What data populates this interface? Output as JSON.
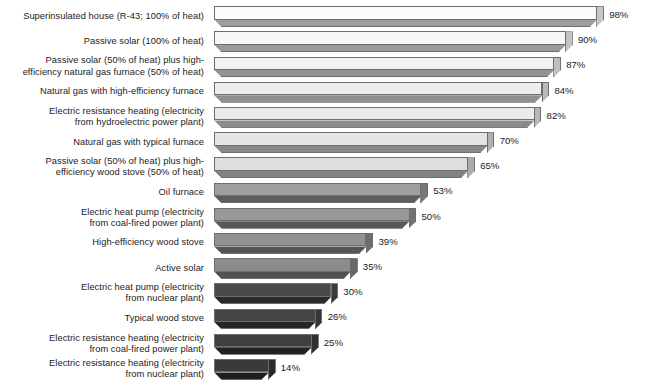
{
  "chart_data": {
    "type": "bar",
    "orientation": "horizontal",
    "title": "",
    "subtitle": "",
    "xlabel": "",
    "ylabel": "",
    "xlim": [
      0,
      100
    ],
    "grid": false,
    "legend": null,
    "value_suffix": "%",
    "categories": [
      "Superinsulated house (R-43; 100% of heat)",
      "Passive solar (100% of heat)",
      "Passive solar (50% of heat) plus high-efficiency natural gas furnace (50% of heat)",
      "Natural gas with high-efficiency furnace",
      "Electric resistance heating (electricity from hydroelectric power plant)",
      "Natural gas with typical furnace",
      "Passive solar (50% of heat) plus high-efficiency wood stove (50% of heat)",
      "Oil furnace",
      "Electric heat pump (electricity from coal-fired power plant)",
      "High-efficiency wood stove",
      "Active solar",
      "Electric heat pump (electricity from nuclear plant)",
      "Typical wood stove",
      "Electric resistance heating (electricity from coal-fired power plant)",
      "Electric resistance heating (electricity from nuclear plant)"
    ],
    "values": [
      98,
      90,
      87,
      84,
      82,
      70,
      65,
      53,
      50,
      39,
      35,
      30,
      26,
      25,
      14
    ]
  },
  "rows": [
    {
      "lines": [
        "Superinsulated house (R-43; 100% of heat)"
      ],
      "value": 98,
      "value_label": "98%",
      "face_color": "#fbfbfb",
      "bottom_color": "#9d9d9d",
      "cap_color": "#c7c7c7"
    },
    {
      "lines": [
        "Passive solar (100% of heat)"
      ],
      "value": 90,
      "value_label": "90%",
      "face_color": "#f7f7f7",
      "bottom_color": "#999999",
      "cap_color": "#c3c3c3"
    },
    {
      "lines": [
        "Passive solar (50% of heat) plus high-",
        "efficiency natural gas furnace (50% of heat)"
      ],
      "value": 87,
      "value_label": "87%",
      "face_color": "#f2f2f2",
      "bottom_color": "#949494",
      "cap_color": "#bfbfbf"
    },
    {
      "lines": [
        "Natural gas with high-efficiency furnace"
      ],
      "value": 84,
      "value_label": "84%",
      "face_color": "#eeeeee",
      "bottom_color": "#909090",
      "cap_color": "#bababa"
    },
    {
      "lines": [
        "Electric resistance heating (electricity",
        "from hydroelectric power plant)"
      ],
      "value": 82,
      "value_label": "82%",
      "face_color": "#eaeaea",
      "bottom_color": "#8c8c8c",
      "cap_color": "#b6b6b6"
    },
    {
      "lines": [
        "Natural gas with typical furnace"
      ],
      "value": 70,
      "value_label": "70%",
      "face_color": "#e4e4e4",
      "bottom_color": "#888888",
      "cap_color": "#b1b1b1"
    },
    {
      "lines": [
        "Passive solar (50% of heat) plus high-",
        "efficiency wood stove (50% of heat)"
      ],
      "value": 65,
      "value_label": "65%",
      "face_color": "#dedede",
      "bottom_color": "#838383",
      "cap_color": "#ababab"
    },
    {
      "lines": [
        "Oil furnace"
      ],
      "value": 53,
      "value_label": "53%",
      "face_color": "#9e9e9e",
      "bottom_color": "#5e5e5e",
      "cap_color": "#777777"
    },
    {
      "lines": [
        "Electric heat pump (electricity",
        "from coal-fired power plant)"
      ],
      "value": 50,
      "value_label": "50%",
      "face_color": "#989898",
      "bottom_color": "#595959",
      "cap_color": "#727272"
    },
    {
      "lines": [
        "High-efficiency wood stove"
      ],
      "value": 39,
      "value_label": "39%",
      "face_color": "#929292",
      "bottom_color": "#555555",
      "cap_color": "#6d6d6d"
    },
    {
      "lines": [
        "Active solar"
      ],
      "value": 35,
      "value_label": "35%",
      "face_color": "#8c8c8c",
      "bottom_color": "#515151",
      "cap_color": "#686868"
    },
    {
      "lines": [
        "Electric heat pump (electricity",
        "from nuclear plant)"
      ],
      "value": 30,
      "value_label": "30%",
      "face_color": "#4a4a4a",
      "bottom_color": "#2a2a2a",
      "cap_color": "#3a3a3a"
    },
    {
      "lines": [
        "Typical wood stove"
      ],
      "value": 26,
      "value_label": "26%",
      "face_color": "#454545",
      "bottom_color": "#262626",
      "cap_color": "#353535"
    },
    {
      "lines": [
        "Electric resistance heating (electricity",
        "from coal-fired power plant)"
      ],
      "value": 25,
      "value_label": "25%",
      "face_color": "#3f3f3f",
      "bottom_color": "#222222",
      "cap_color": "#303030"
    },
    {
      "lines": [
        "Electric resistance heating (electricity",
        "from nuclear plant)"
      ],
      "value": 14,
      "value_label": "14%",
      "face_color": "#3a3a3a",
      "bottom_color": "#1e1e1e",
      "cap_color": "#2b2b2b"
    }
  ]
}
